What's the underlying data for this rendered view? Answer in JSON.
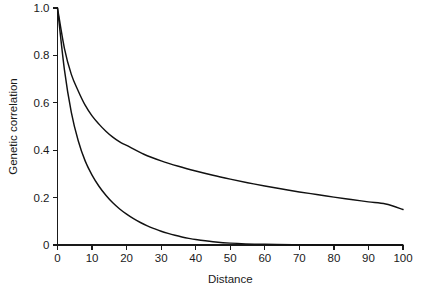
{
  "chart_data": {
    "type": "line",
    "title": "",
    "subtitle": "",
    "xlabel": "Distance",
    "ylabel": "Genetic correlation",
    "xlim": [
      0,
      100
    ],
    "ylim": [
      0,
      1.0
    ],
    "grid": false,
    "legend": "none",
    "xticks": [
      0,
      10,
      20,
      30,
      40,
      50,
      60,
      70,
      80,
      90,
      100
    ],
    "xtick_labels": [
      "0",
      "10",
      "20",
      "30",
      "40",
      "50",
      "60",
      "70",
      "80",
      "90",
      "100"
    ],
    "yticks": [
      0,
      0.2,
      0.4,
      0.6,
      0.8,
      1.0
    ],
    "ytick_labels": [
      "0",
      "0.2",
      "0.4",
      "0.6",
      "0.8",
      "1.0"
    ],
    "series": [
      {
        "name": "slow-decay curve",
        "x": [
          0,
          2,
          4,
          6,
          8,
          10,
          12,
          14,
          16,
          18,
          20,
          25,
          30,
          35,
          40,
          45,
          50,
          55,
          60,
          65,
          70,
          75,
          80,
          85,
          90,
          95,
          100
        ],
        "values": [
          1.0,
          0.83,
          0.72,
          0.65,
          0.59,
          0.545,
          0.51,
          0.48,
          0.455,
          0.435,
          0.42,
          0.383,
          0.355,
          0.332,
          0.312,
          0.294,
          0.278,
          0.263,
          0.249,
          0.236,
          0.224,
          0.213,
          0.202,
          0.192,
          0.182,
          0.173,
          0.15
        ]
      },
      {
        "name": "fast-decay curve",
        "x": [
          0,
          2,
          4,
          6,
          8,
          10,
          12,
          14,
          16,
          18,
          20,
          22,
          24,
          26,
          28,
          30,
          32,
          34,
          36,
          38,
          40,
          45,
          50,
          60,
          70,
          80,
          90,
          100
        ],
        "values": [
          1.0,
          0.74,
          0.56,
          0.44,
          0.355,
          0.295,
          0.248,
          0.21,
          0.178,
          0.152,
          0.13,
          0.111,
          0.095,
          0.081,
          0.069,
          0.058,
          0.049,
          0.041,
          0.034,
          0.028,
          0.023,
          0.014,
          0.008,
          0.003,
          0.001,
          0.0,
          0.0,
          0.0
        ]
      }
    ],
    "colors": {
      "curve": "#111111",
      "axis": "#1a1a1a",
      "background": "#ffffff"
    }
  }
}
